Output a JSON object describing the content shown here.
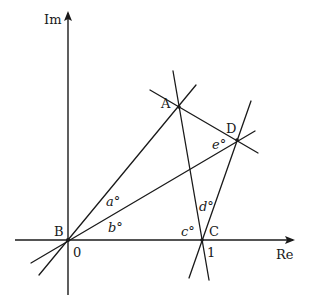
{
  "diagram": {
    "type": "complex-plane-geometry",
    "axes": {
      "imaginary_label": "Im",
      "real_label": "Re",
      "origin_tick": "0",
      "unit_tick": "1"
    },
    "points": {
      "A": "A",
      "B": "B",
      "C": "C",
      "D": "D"
    },
    "angles": {
      "a": "a°",
      "b": "b°",
      "c": "c°",
      "d": "d°",
      "e": "e°"
    },
    "lines": [
      "BA",
      "BD",
      "AC",
      "CD",
      "AD"
    ],
    "color": "#1a1a1a"
  }
}
